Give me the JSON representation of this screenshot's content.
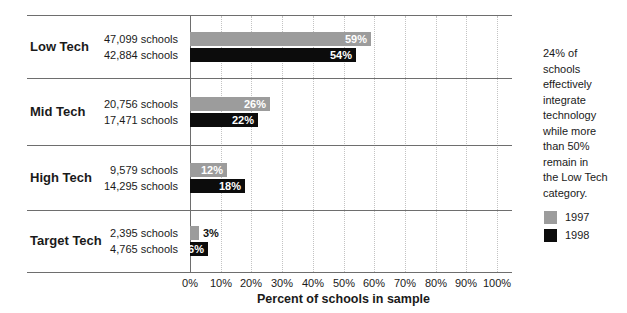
{
  "chart_data": {
    "type": "bar",
    "orientation": "horizontal",
    "categories": [
      "Low Tech",
      "Mid Tech",
      "High Tech",
      "Target Tech"
    ],
    "series": [
      {
        "name": "1997",
        "color": "#9c9c9c",
        "values": [
          59,
          26,
          12,
          3
        ],
        "value_labels": [
          "59%",
          "26%",
          "12%",
          "3%"
        ],
        "count_labels": [
          "47,099 schools",
          "20,756 schools",
          "9,579 schools",
          "2,395 schools"
        ]
      },
      {
        "name": "1998",
        "color": "#0c0c0c",
        "values": [
          54,
          22,
          18,
          6
        ],
        "value_labels": [
          "54%",
          "22%",
          "18%",
          "6%"
        ],
        "count_labels": [
          "42,884 schools",
          "17,471 schools",
          "14,295 schools",
          "4,765 schools"
        ]
      }
    ],
    "xlabel": "Percent of schools in sample",
    "xlim": [
      0,
      100
    ],
    "xticks": [
      "0%",
      "10%",
      "20%",
      "30%",
      "40%",
      "50%",
      "60%",
      "70%",
      "80%",
      "90%",
      "100%"
    ],
    "grid": "vertical-dotted",
    "legend_position": "right-bottom"
  },
  "annotation": {
    "text": "24% of schools effectively integrate technology while more than 50% remain in the Low Tech category.",
    "lines": [
      "24% of",
      "schools",
      "effectively",
      "integrate",
      "technology",
      "while more",
      "than 50%",
      "remain in",
      "the Low Tech",
      "category."
    ]
  },
  "colors": {
    "series_1997": "#9c9c9c",
    "series_1998": "#0c0c0c",
    "rule_line": "#6e6e6e",
    "gridline": "#c3c3c3",
    "text": "#1a1a1a",
    "bar_label_inside": "#ffffff"
  }
}
